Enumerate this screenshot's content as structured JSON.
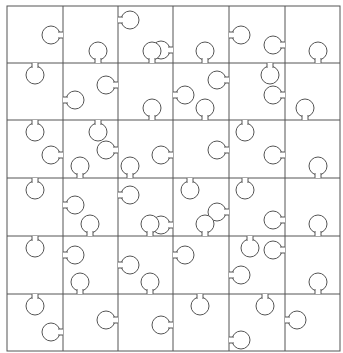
{
  "puzzle": {
    "rows": 6,
    "cols": 6,
    "x_lines": [
      7,
      63,
      118,
      173,
      229,
      285,
      340
    ],
    "y_lines": [
      6,
      63,
      120,
      178,
      236,
      294,
      351
    ],
    "line_color": "#555555",
    "background": "#ffffff",
    "knob_radius": 9,
    "vertical_knobs": [
      [
        [
          63,
          35,
          -1
        ],
        [
          118,
          20,
          1
        ],
        [
          173,
          50,
          -1
        ],
        [
          229,
          35,
          1
        ],
        [
          285,
          45,
          -1
        ]
      ],
      [
        [
          63,
          100,
          1
        ],
        [
          118,
          85,
          -1
        ],
        [
          173,
          95,
          1
        ],
        [
          229,
          80,
          -1
        ],
        [
          285,
          95,
          -1
        ]
      ],
      [
        [
          63,
          155,
          -1
        ],
        [
          118,
          150,
          -1
        ],
        [
          173,
          155,
          -1
        ],
        [
          229,
          150,
          -1
        ],
        [
          285,
          155,
          -1
        ]
      ],
      [
        [
          63,
          205,
          1
        ],
        [
          118,
          195,
          1
        ],
        [
          173,
          225,
          -1
        ],
        [
          229,
          212,
          -1
        ],
        [
          285,
          220,
          -1
        ]
      ],
      [
        [
          63,
          255,
          1
        ],
        [
          118,
          265,
          1
        ],
        [
          173,
          255,
          1
        ],
        [
          229,
          275,
          1
        ],
        [
          285,
          250,
          -1
        ]
      ],
      [
        [
          63,
          332,
          -1
        ],
        [
          118,
          320,
          -1
        ],
        [
          173,
          325,
          -1
        ],
        [
          229,
          340,
          1
        ],
        [
          285,
          320,
          1
        ]
      ]
    ],
    "horizontal_knobs": [
      [
        [
          35,
          63,
          1
        ],
        [
          98,
          63,
          -1
        ],
        [
          152,
          63,
          -1
        ],
        [
          205,
          63,
          -1
        ],
        [
          270,
          63,
          1
        ],
        [
          318,
          63,
          -1
        ]
      ],
      [
        [
          35,
          120,
          1
        ],
        [
          98,
          120,
          1
        ],
        [
          152,
          120,
          -1
        ],
        [
          205,
          120,
          -1
        ],
        [
          245,
          120,
          1
        ],
        [
          305,
          120,
          -1
        ]
      ],
      [
        [
          35,
          178,
          1
        ],
        [
          80,
          178,
          -1
        ],
        [
          130,
          178,
          -1
        ],
        [
          190,
          178,
          1
        ],
        [
          245,
          178,
          1
        ],
        [
          318,
          178,
          -1
        ]
      ],
      [
        [
          35,
          236,
          1
        ],
        [
          90,
          236,
          -1
        ],
        [
          150,
          236,
          -1
        ],
        [
          205,
          236,
          -1
        ],
        [
          250,
          236,
          1
        ],
        [
          318,
          236,
          -1
        ]
      ],
      [
        [
          35,
          294,
          1
        ],
        [
          80,
          294,
          -1
        ],
        [
          150,
          294,
          -1
        ],
        [
          200,
          294,
          1
        ],
        [
          265,
          294,
          1
        ],
        [
          318,
          294,
          -1
        ]
      ]
    ]
  }
}
